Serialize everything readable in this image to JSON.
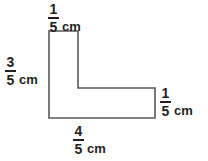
{
  "figure": {
    "shape_name": "l-shape-polygon",
    "unit": "cm",
    "stroke_color": "#595959",
    "fill_color": "none",
    "text_color": "#231f20",
    "background_color": "#ffffff",
    "vertices": [
      {
        "x": 49,
        "y": 31
      },
      {
        "x": 78,
        "y": 31
      },
      {
        "x": 78,
        "y": 88
      },
      {
        "x": 155,
        "y": 88
      },
      {
        "x": 155,
        "y": 118
      },
      {
        "x": 49,
        "y": 118
      }
    ]
  },
  "labels": {
    "top": {
      "name": "top-side-length",
      "numerator": "1",
      "denominator": "5",
      "unit": "cm",
      "full_text": "1/5 cm"
    },
    "left": {
      "name": "left-side-length",
      "numerator": "3",
      "denominator": "5",
      "unit": "cm",
      "full_text": "3/5 cm"
    },
    "right": {
      "name": "right-side-length",
      "numerator": "1",
      "denominator": "5",
      "unit": "cm",
      "full_text": "1/5 cm"
    },
    "bottom": {
      "name": "bottom-side-length",
      "numerator": "4",
      "denominator": "5",
      "unit": "cm",
      "full_text": "4/5 cm"
    }
  }
}
